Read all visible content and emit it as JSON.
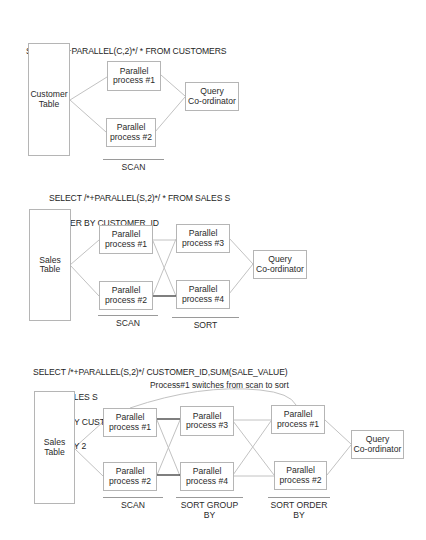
{
  "diagrams": [
    {
      "query": [
        "SELECT /*+PARALLEL(C,2)*/ * FROM CUSTOMERS"
      ],
      "table": [
        "Customer",
        "Table"
      ],
      "processes": {
        "p1": [
          "Parallel",
          "process #1"
        ],
        "p2": [
          "Parallel",
          "process #2"
        ]
      },
      "coordinator": [
        "Query",
        "Co-ordinator"
      ],
      "stages": [
        {
          "label": [
            "SCAN"
          ]
        }
      ]
    },
    {
      "query": [
        "SELECT /*+PARALLEL(S,2)*/ * FROM SALES S",
        " ORDER BY CUSTOMER_ID"
      ],
      "table": [
        "Sales",
        "Table"
      ],
      "processes": {
        "p1": [
          "Parallel",
          "process #1"
        ],
        "p2": [
          "Parallel",
          "process #2"
        ],
        "p3": [
          "Parallel",
          "process #3"
        ],
        "p4": [
          "Parallel",
          "process #4"
        ]
      },
      "coordinator": [
        "Query",
        "Co-ordinator"
      ],
      "stages": [
        {
          "label": [
            "SCAN"
          ]
        },
        {
          "label": [
            "SORT"
          ]
        }
      ]
    },
    {
      "query": [
        "SELECT /*+PARALLEL(S,2)*/ CUSTOMER_ID,SUM(SALE_VALUE)",
        " FROM SALES S",
        " GROUP BY CUSTOMER_ID",
        " ORDER BY 2"
      ],
      "note": "Process#1 switches from scan to sort",
      "table": [
        "Sales",
        "Table"
      ],
      "processes": {
        "p1": [
          "Parallel",
          "process #1"
        ],
        "p2": [
          "Parallel",
          "process #2"
        ],
        "p3": [
          "Parallel",
          "process #3"
        ],
        "p4": [
          "Parallel",
          "process #4"
        ],
        "p1b": [
          "Parallel",
          "process #1"
        ],
        "p2b": [
          "Parallel",
          "process #2"
        ]
      },
      "coordinator": [
        "Query",
        "Co-ordinator"
      ],
      "stages": [
        {
          "label": [
            "SCAN"
          ]
        },
        {
          "label": [
            "SORT",
            "GROUP BY"
          ]
        },
        {
          "label": [
            "SORT",
            "ORDER BY"
          ]
        }
      ]
    }
  ],
  "colors": {
    "box_border": "#b5b5b5",
    "connector": "#bdbdbd",
    "connector_strong": "#3a3a3a",
    "text": "#222222"
  }
}
